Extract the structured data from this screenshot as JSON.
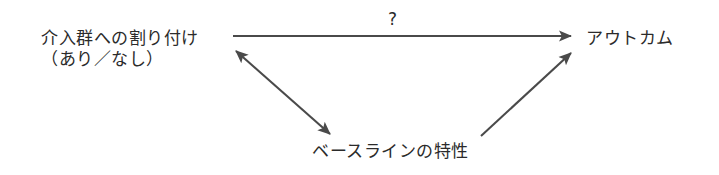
{
  "figure": {
    "background_color": "#ffffff",
    "stroke_color": "#4a4a4a",
    "text_color": "#2b2b2b"
  },
  "nodes": {
    "allocation": {
      "line1": "介入群への割り付け",
      "line2": "（あり／なし）"
    },
    "outcome": {
      "label": "アウトカム"
    },
    "baseline": {
      "label": "ベースラインの特性"
    }
  },
  "edges": {
    "allocation_to_outcome": {
      "label": "?",
      "direction": "one-way",
      "from": "allocation",
      "to": "outcome"
    },
    "allocation_baseline": {
      "label": "",
      "direction": "two-way",
      "from": "allocation",
      "to": "baseline"
    },
    "baseline_to_outcome": {
      "label": "",
      "direction": "one-way",
      "from": "baseline",
      "to": "outcome"
    }
  }
}
